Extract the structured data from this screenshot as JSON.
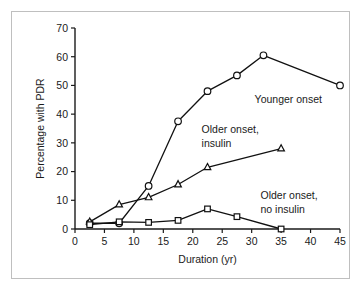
{
  "chart_data": {
    "type": "line",
    "title": "",
    "xlabel": "Duration (yr)",
    "ylabel": "Percentage with PDR",
    "xlim": [
      0,
      45
    ],
    "ylim": [
      0,
      70
    ],
    "xticks": [
      0,
      5,
      10,
      15,
      20,
      25,
      30,
      35,
      40,
      45
    ],
    "yticks": [
      0,
      10,
      20,
      30,
      40,
      50,
      60,
      70
    ],
    "grid": false,
    "legend_position": "inline-annotations",
    "series": [
      {
        "name": "Younger onset",
        "label_line1": "Younger onset",
        "label_line2": "",
        "marker": "circle",
        "x": [
          2.5,
          7.5,
          12.5,
          17.5,
          22.5,
          27.5,
          32,
          45
        ],
        "values": [
          2,
          2,
          15,
          37.5,
          48,
          53.5,
          60.5,
          50
        ]
      },
      {
        "name": "Older onset, insulin",
        "label_line1": "Older onset,",
        "label_line2": "insulin",
        "marker": "triangle",
        "x": [
          2.5,
          7.5,
          12.5,
          17.5,
          22.5,
          35
        ],
        "values": [
          2.5,
          8.5,
          11,
          15.5,
          21.5,
          28
        ]
      },
      {
        "name": "Older onset, no insulin",
        "label_line1": "Older onset,",
        "label_line2": "no insulin",
        "marker": "square",
        "x": [
          2.5,
          7.5,
          12.5,
          17.5,
          22.5,
          27.5,
          35
        ],
        "values": [
          1.5,
          2.5,
          2.3,
          3,
          7,
          4.3,
          0
        ]
      }
    ],
    "annotations": [
      {
        "text": "Younger onset",
        "x": 30.5,
        "y": 44
      },
      {
        "text": "Older onset,",
        "x": 21.5,
        "y": 33.5
      },
      {
        "text": "insulin",
        "x": 21.5,
        "y": 28.5
      },
      {
        "text": "Older onset,",
        "x": 31.5,
        "y": 10.5
      },
      {
        "text": "no insulin",
        "x": 31.5,
        "y": 5.5
      }
    ],
    "colors": {
      "line": "#111111",
      "marker_fill": "#ffffff",
      "axis": "#1a1a1a",
      "frame": "#bfbfbf",
      "background": "#ffffff"
    }
  }
}
